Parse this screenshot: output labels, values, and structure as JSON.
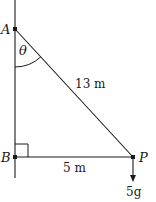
{
  "diagram": {
    "points": {
      "A": {
        "label": "A",
        "x": 15,
        "y": 29
      },
      "B": {
        "label": "B",
        "x": 15,
        "y": 157
      },
      "P": {
        "label": "P",
        "x": 133,
        "y": 157
      }
    },
    "angle_label": "θ",
    "hypotenuse_label": "13 m",
    "base_label": "5 m",
    "force_label": "5g",
    "colors": {
      "line": "#1a1a1a",
      "background": "#ffffff"
    }
  }
}
